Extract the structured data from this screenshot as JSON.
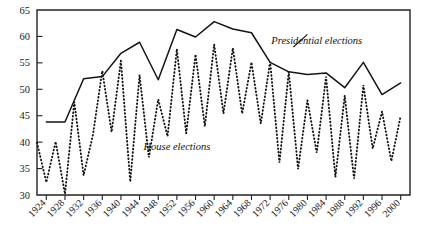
{
  "chart_data": {
    "type": "line",
    "title": "",
    "subtitle": "",
    "xlabel": "",
    "ylabel": "",
    "xlim": [
      1922,
      2002
    ],
    "ylim": [
      30,
      65
    ],
    "grid": false,
    "legend_position": "inline-annotations",
    "y_ticks": [
      30,
      35,
      40,
      45,
      50,
      55,
      60,
      65
    ],
    "y_tick_labels": [
      "30",
      "35",
      "40",
      "45",
      "50",
      "55",
      "60",
      "65"
    ],
    "x_ticks": [
      1924,
      1928,
      1932,
      1936,
      1940,
      1944,
      1948,
      1952,
      1956,
      1960,
      1964,
      1968,
      1972,
      1976,
      1980,
      1984,
      1988,
      1992,
      1996,
      2000
    ],
    "x_tick_labels": [
      "1924",
      "1928",
      "1932",
      "1936",
      "1940",
      "1944",
      "1948",
      "1952",
      "1956",
      "1960",
      "1964",
      "1968",
      "1972",
      "1976",
      "1980",
      "1984",
      "1988",
      "1992",
      "1996",
      "2000"
    ],
    "annotations": [
      {
        "name": "presidential-label",
        "text": "Presidential elections",
        "x": 1982,
        "y": 58.6
      },
      {
        "name": "house-label",
        "text": "House elections",
        "x": 1952,
        "y": 38.6
      }
    ],
    "series": [
      {
        "name": "Presidential elections",
        "style": "solid",
        "x": [
          1924,
          1928,
          1932,
          1936,
          1940,
          1944,
          1948,
          1952,
          1956,
          1960,
          1964,
          1968,
          1972,
          1976,
          1980,
          1984,
          1988,
          1992,
          1996,
          2000
        ],
        "values": [
          43.8,
          43.8,
          52.0,
          52.4,
          56.8,
          58.9,
          51.8,
          61.3,
          59.9,
          62.8,
          61.4,
          60.7,
          55.1,
          53.3,
          52.8,
          53.1,
          50.3,
          55.1,
          49.0,
          51.2
        ]
      },
      {
        "name": "House elections",
        "style": "dotted",
        "x": [
          1922,
          1924,
          1926,
          1928,
          1930,
          1932,
          1934,
          1936,
          1938,
          1940,
          1942,
          1944,
          1946,
          1948,
          1950,
          1952,
          1954,
          1956,
          1958,
          1960,
          1962,
          1964,
          1966,
          1968,
          1970,
          1972,
          1974,
          1976,
          1978,
          1980,
          1982,
          1984,
          1986,
          1988,
          1990,
          1992,
          1994,
          1996,
          1998,
          2000
        ],
        "values": [
          39.9,
          32.4,
          40.1,
          30.2,
          47.6,
          33.7,
          41.4,
          53.5,
          41.9,
          55.4,
          32.5,
          52.7,
          37.1,
          48.1,
          41.1,
          57.6,
          41.7,
          56.6,
          43.0,
          58.5,
          45.4,
          57.8,
          45.4,
          55.1,
          43.5,
          55.2,
          36.1,
          53.3,
          34.9,
          47.9,
          38.0,
          52.4,
          33.4,
          48.8,
          33.1,
          50.8,
          38.8,
          45.8,
          36.4,
          45.0
        ]
      }
    ]
  }
}
